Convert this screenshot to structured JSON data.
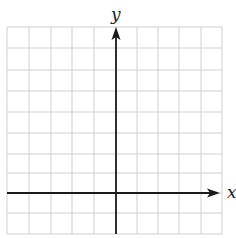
{
  "diagram": {
    "type": "coordinate-plane",
    "grid": {
      "left": 7,
      "top": 27,
      "right": 222,
      "bottom": 234,
      "vertical_lines_x": [
        7,
        29,
        51,
        72,
        94,
        116,
        137,
        158,
        179,
        201,
        222
      ],
      "horizontal_lines_y": [
        27,
        48,
        70,
        91,
        112,
        133,
        154,
        173,
        193,
        213,
        234
      ],
      "color": "#cfcfcf"
    },
    "axes": {
      "color": "#1a1a1a",
      "x_axis": {
        "y": 193,
        "x_start": 7,
        "x_end": 220,
        "label": "x",
        "arrow": "right"
      },
      "y_axis": {
        "x": 116,
        "y_start": 234,
        "y_end": 27,
        "label": "y",
        "arrow": "up"
      }
    }
  }
}
